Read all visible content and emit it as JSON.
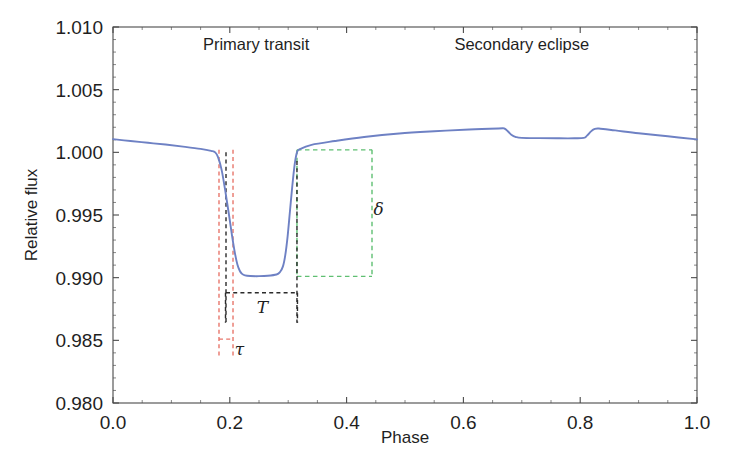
{
  "chart_data": {
    "type": "line",
    "title": "",
    "xlabel": "Phase",
    "ylabel": "Relative flux",
    "xlim": [
      0.0,
      1.0
    ],
    "ylim": [
      0.98,
      1.01
    ],
    "grid": false,
    "legend": "none",
    "xticks": [
      "0.0",
      "0.2",
      "0.4",
      "0.6",
      "0.8",
      "1.0"
    ],
    "xtick_values": [
      0.0,
      0.2,
      0.4,
      0.6,
      0.8,
      1.0
    ],
    "yticks": [
      "0.980",
      "0.985",
      "0.990",
      "0.995",
      "1.000",
      "1.005",
      "1.010"
    ],
    "ytick_values": [
      0.98,
      0.985,
      0.99,
      0.995,
      1.0,
      1.005,
      1.01
    ],
    "xminor_step": 0.05,
    "yminor_step": 0.001,
    "series": [
      {
        "name": "relative flux",
        "color": "#6e81c4",
        "x": [
          0.0,
          0.03,
          0.06,
          0.09,
          0.12,
          0.15,
          0.168,
          0.175,
          0.18,
          0.186,
          0.192,
          0.198,
          0.204,
          0.209,
          0.213,
          0.217,
          0.221,
          0.226,
          0.235,
          0.25,
          0.265,
          0.28,
          0.286,
          0.291,
          0.295,
          0.299,
          0.303,
          0.307,
          0.311,
          0.315,
          0.32,
          0.34,
          0.38,
          0.43,
          0.49,
          0.55,
          0.61,
          0.66,
          0.67,
          0.676,
          0.682,
          0.69,
          0.7,
          0.73,
          0.76,
          0.79,
          0.806,
          0.812,
          0.818,
          0.824,
          0.832,
          0.86,
          0.9,
          0.95,
          1.0
        ],
        "y": [
          1.00105,
          1.0009,
          1.00076,
          1.00062,
          1.00046,
          1.00028,
          1.00012,
          1.0,
          0.9996,
          0.9986,
          0.997,
          0.9952,
          0.9933,
          0.9919,
          0.99105,
          0.99055,
          0.9903,
          0.99018,
          0.99013,
          0.99012,
          0.99015,
          0.99025,
          0.99045,
          0.9909,
          0.9918,
          0.9933,
          0.9953,
          0.9973,
          0.999,
          1.0,
          1.00025,
          1.0006,
          1.0009,
          1.00122,
          1.0015,
          1.00168,
          1.00182,
          1.0019,
          1.0019,
          1.00168,
          1.0014,
          1.00122,
          1.00115,
          1.00113,
          1.00112,
          1.00112,
          1.00115,
          1.00135,
          1.00165,
          1.00185,
          1.0019,
          1.00175,
          1.00152,
          1.00128,
          1.00103
        ]
      }
    ],
    "annotations": [
      {
        "name": "primary-transit-label",
        "text": "Primary transit",
        "x": 0.245,
        "y": 1.0082
      },
      {
        "name": "secondary-eclipse-label",
        "text": "Secondary eclipse",
        "x": 0.7,
        "y": 1.0082
      },
      {
        "name": "depth-symbol",
        "text": "δ",
        "color": "#2b2b2b",
        "x": 0.455,
        "y": 0.995
      },
      {
        "name": "duration-symbol",
        "text": "T",
        "color": "#2b2b2b",
        "x": 0.256,
        "y": 0.9872
      },
      {
        "name": "ingress-symbol",
        "text": "τ",
        "color": "#2b2b2b",
        "x": 0.2165,
        "y": 0.9838
      }
    ],
    "markers": {
      "transit_depth": 0.0099,
      "transit_ingress_phase": 0.175,
      "transit_flat_start_phase": 0.212,
      "transit_flat_end_phase": 0.29,
      "transit_egress_phase": 0.315,
      "secondary_start_phase": 0.67,
      "secondary_end_phase": 0.82,
      "tau_left_phase": 0.1815,
      "tau_right_phase": 0.2055,
      "T_left_phase": 0.1935,
      "T_right_phase": 0.315,
      "delta_box_left_phase": 0.315,
      "delta_box_right_phase": 0.4435,
      "delta_box_top_flux": 1.0002,
      "delta_box_bottom_flux": 0.9901
    },
    "colors": {
      "curve": "#6e81c4",
      "tau_guide": "#e8766b",
      "T_guide": "#2b2b2b",
      "delta_guide": "#5fbf72",
      "axis": "#4a4a4a",
      "background": "#ffffff"
    }
  }
}
